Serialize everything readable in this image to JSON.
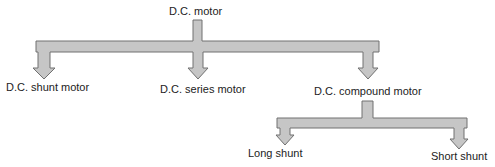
{
  "diagram": {
    "root": "D.C. motor",
    "level1": [
      "D.C. shunt motor",
      "D.C. series motor",
      "D.C. compound motor"
    ],
    "level2": [
      "Long shunt",
      "Short shunt"
    ],
    "colors": {
      "fill": "#c4c4c4",
      "stroke": "#6a6a6a",
      "text": "#222222"
    }
  }
}
